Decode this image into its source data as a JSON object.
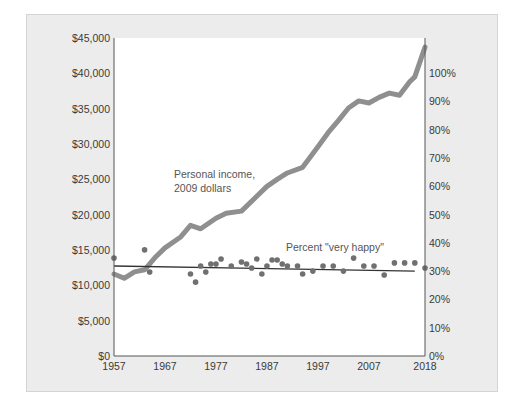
{
  "chart_data": {
    "type": "line",
    "title": "",
    "xlabel": "",
    "ylabel_left": "Personal income, 2009 dollars",
    "ylabel_right": "Percent \"very happy\"",
    "x_ticks": [
      "1957",
      "1967",
      "1977",
      "1987",
      "1997",
      "2007",
      "2018"
    ],
    "xlim": [
      1957,
      2018
    ],
    "y_left_ticks": [
      "$0",
      "$5,000",
      "$10,000",
      "$15,000",
      "$20,000",
      "$25,000",
      "$30,000",
      "$35,000",
      "$40,000",
      "$45,000"
    ],
    "ylim_left": [
      0,
      45000
    ],
    "y_right_ticks": [
      "0%",
      "10%",
      "20%",
      "30%",
      "40%",
      "50%",
      "60%",
      "70%",
      "80%",
      "90%",
      "100%"
    ],
    "ylim_right": [
      0,
      112
    ],
    "grid": false,
    "annotations": [
      {
        "text": "Personal income,",
        "line": 1
      },
      {
        "text": "2009 dollars",
        "line": 2
      },
      {
        "text": "Percent \"very happy\""
      }
    ],
    "series": [
      {
        "name": "Personal income, 2009 dollars",
        "axis": "left",
        "style": "thick-line",
        "color": "#8f8f8f",
        "x": [
          1957,
          1959,
          1961,
          1963,
          1965,
          1967,
          1970,
          1972,
          1974,
          1977,
          1979,
          1982,
          1985,
          1987,
          1989,
          1991,
          1994,
          1997,
          1999,
          2001,
          2003,
          2005,
          2007,
          2009,
          2011,
          2013,
          2015,
          2016,
          2018
        ],
        "values": [
          11600,
          11000,
          11900,
          12200,
          13900,
          15300,
          16800,
          18500,
          18000,
          19500,
          20200,
          20500,
          22600,
          24000,
          25000,
          25900,
          26700,
          29600,
          31600,
          33300,
          35100,
          36100,
          35800,
          36600,
          37200,
          36900,
          38800,
          39500,
          43700
        ]
      },
      {
        "name": "Percent \"very happy\"",
        "axis": "right",
        "style": "scatter",
        "color": "#707070",
        "x": [
          1957,
          1963,
          1964,
          1972,
          1973,
          1974,
          1975,
          1976,
          1977,
          1978,
          1980,
          1982,
          1983,
          1984,
          1985,
          1986,
          1987,
          1988,
          1989,
          1990,
          1991,
          1993,
          1994,
          1996,
          1998,
          2000,
          2002,
          2004,
          2006,
          2008,
          2010,
          2012,
          2014,
          2016,
          2018
        ],
        "values": [
          34.6,
          37.5,
          29.7,
          29.0,
          26.1,
          31.8,
          29.7,
          32.5,
          32.5,
          34.3,
          31.8,
          33.2,
          32.5,
          31.1,
          34.3,
          29.0,
          31.8,
          33.9,
          33.9,
          32.5,
          31.8,
          31.8,
          29.0,
          30.0,
          31.8,
          31.8,
          30.0,
          34.6,
          31.8,
          31.8,
          28.6,
          32.9,
          32.9,
          32.9,
          31.1
        ]
      },
      {
        "name": "Very happy trend",
        "axis": "right",
        "style": "thin-line",
        "color": "#333333",
        "x": [
          1957,
          2016
        ],
        "values": [
          31.8,
          30.0
        ]
      }
    ]
  }
}
